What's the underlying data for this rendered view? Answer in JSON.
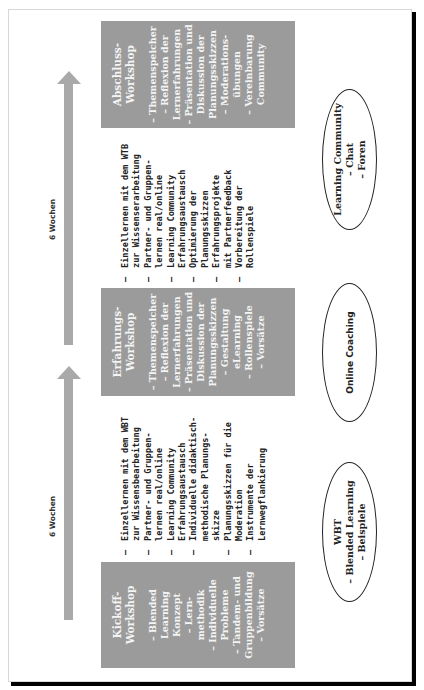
{
  "diagram": {
    "timeline": {
      "intervals": [
        {
          "label": "6 Wochen"
        },
        {
          "label": "6 Wochen"
        }
      ]
    },
    "workshops": [
      {
        "title": "Kickoff-\nWorkshop",
        "items": "– Blended\nLearning\nKonzept\n– Lern-\nmethodik\n– Individuelle\nProbleme\n– Tandem- und\nGruppenbildung\n– Vorsätze"
      },
      {
        "title": "Erfahrungs-\nWorkshop",
        "items": "– Themenspeicher\n– Reflexion der\nLernerfahrungen\n– Präsentation und\nDiskussion der\nPlanungsskizzen\n– Gestaltung\neLearning\n– Rollenspiele\n– Vorsätze"
      },
      {
        "title": "Abschluss-\nWorkshop",
        "items": "– Themenspeicher\n– Reflexion der\nLernerfahrungen\n– Präsentation und\nDiskussion der\nPlanungsskizzen\n– Moderations-\nübungen\n– Vereinbarung\nCommunity"
      }
    ],
    "phase_lists": [
      {
        "items": [
          "Einzellernen mit dem WBT\nzur Wissensbearbeitung",
          "Partner- und Gruppen-\nlernen real/online",
          "Learning Community\nErfahrungsaustausch",
          "Individuelle didaktisch-\nmethodische Planungs-\nskizze",
          "Planungsskizzen für die\nModeration",
          "Instrumente der\nLernwegflankierung"
        ]
      },
      {
        "items": [
          "Einzellernen mit dem WTB\nzur Wissenserarbeitung",
          "Partner- und Gruppen-\nlernen real/online",
          "Learning Community\nErfahrungsaustausch",
          "Optimierung der\nPlanungsskizzen",
          "Erfahrungsprojekte\nmit Partnerfeedback",
          "Vorbereitung der\nRollenspiele"
        ]
      }
    ],
    "support": [
      {
        "text": "WBT\n– Blended Learning\n– Beispiele"
      },
      {
        "text": "Online Coaching"
      },
      {
        "text": "Learning Community\n– Chat\n– Foren"
      }
    ],
    "colors": {
      "box_fill": "#9b9b9b",
      "arrow": "#a9a9a9",
      "box_text": "#f4f4f4"
    }
  }
}
